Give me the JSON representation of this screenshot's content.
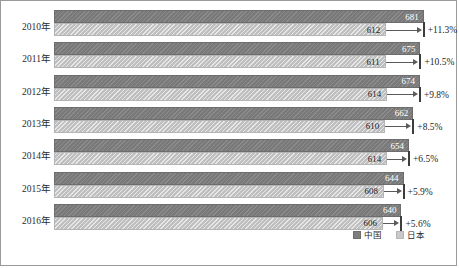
{
  "chart_data": {
    "type": "bar",
    "orientation": "horizontal",
    "title": "",
    "subtitle": "",
    "xlabel": "",
    "ylabel": "",
    "grid": false,
    "legend_position": "bottom-right",
    "categories": [
      "2010年",
      "2011年",
      "2012年",
      "2013年",
      "2014年",
      "2015年",
      "2016年"
    ],
    "series": [
      {
        "name": "中国",
        "values": [
          681,
          675,
          674,
          662,
          654,
          644,
          640
        ],
        "color": "#7e7e7e"
      },
      {
        "name": "日本",
        "values": [
          612,
          611,
          614,
          610,
          614,
          608,
          606
        ],
        "color": "#c9c9c9"
      }
    ],
    "annotations": [
      "+11.3%",
      "+10.5%",
      "+9.8%",
      "+8.5%",
      "+6.5%",
      "+5.9%",
      "+5.6%"
    ],
    "xlim": [
      0,
      700
    ]
  },
  "rows": [
    {
      "year": "2010年",
      "cn": "681",
      "jp": "612",
      "gap": "+11.3%"
    },
    {
      "year": "2011年",
      "cn": "675",
      "jp": "611",
      "gap": "+10.5%"
    },
    {
      "year": "2012年",
      "cn": "674",
      "jp": "614",
      "gap": "+9.8%"
    },
    {
      "year": "2013年",
      "cn": "662",
      "jp": "610",
      "gap": "+8.5%"
    },
    {
      "year": "2014年",
      "cn": "654",
      "jp": "614",
      "gap": "+6.5%"
    },
    {
      "year": "2015年",
      "cn": "644",
      "jp": "608",
      "gap": "+5.9%"
    },
    {
      "year": "2016年",
      "cn": "640",
      "jp": "606",
      "gap": "+5.6%"
    }
  ],
  "legend": {
    "items": [
      {
        "label": "中国",
        "color": "#7e7e7e"
      },
      {
        "label": "日本",
        "color": "#c9c9c9"
      }
    ]
  }
}
